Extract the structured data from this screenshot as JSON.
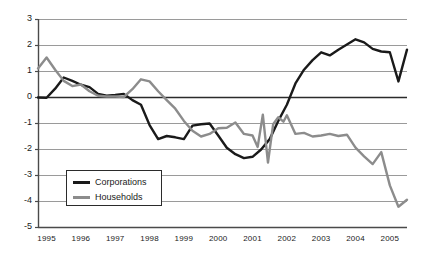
{
  "chart_data": {
    "type": "line",
    "title": "",
    "xlabel": "",
    "ylabel": "",
    "xlim": [
      1994.75,
      2005.5
    ],
    "ylim": [
      -5,
      3
    ],
    "grid": true,
    "legend_position": "lower-left-inside",
    "y_ticks": [
      3,
      2,
      1,
      0,
      -1,
      -2,
      -3,
      -4,
      -5
    ],
    "y_tick_labels": [
      "3",
      "2",
      "1",
      "0",
      "-1",
      "-2",
      "-3",
      "-4",
      "-5"
    ],
    "x_ticks": [
      1995,
      1996,
      1997,
      1998,
      1999,
      2000,
      2001,
      2002,
      2003,
      2004,
      2005
    ],
    "x_tick_labels": [
      "1995",
      "1996",
      "1997",
      "1998",
      "1999",
      "2000",
      "2001",
      "2002",
      "2003",
      "2004",
      "2005"
    ],
    "series": [
      {
        "name": "Corporations",
        "color": "#1a1a1a",
        "width": 2.4,
        "x": [
          1994.75,
          1995.0,
          1995.25,
          1995.5,
          1995.75,
          1996.0,
          1996.25,
          1996.5,
          1996.75,
          1997.0,
          1997.25,
          1997.5,
          1997.75,
          1998.0,
          1998.25,
          1998.5,
          1998.75,
          1999.0,
          1999.25,
          1999.5,
          1999.75,
          2000.0,
          2000.25,
          2000.5,
          2000.75,
          2001.0,
          2001.25,
          2001.5,
          2001.75,
          2002.0,
          2002.25,
          2002.5,
          2002.75,
          2003.0,
          2003.25,
          2003.5,
          2003.75,
          2004.0,
          2004.25,
          2004.5,
          2004.75,
          2005.0,
          2005.25,
          2005.5
        ],
        "y": [
          -0.02,
          -0.03,
          0.32,
          0.75,
          0.62,
          0.47,
          0.38,
          0.12,
          0.05,
          0.08,
          0.12,
          -0.12,
          -0.3,
          -1.08,
          -1.62,
          -1.5,
          -1.55,
          -1.62,
          -1.1,
          -1.05,
          -1.02,
          -1.48,
          -1.95,
          -2.2,
          -2.35,
          -2.3,
          -2.02,
          -1.62,
          -0.92,
          -0.3,
          0.52,
          1.05,
          1.42,
          1.72,
          1.6,
          1.82,
          2.02,
          2.22,
          2.1,
          1.85,
          1.75,
          1.72,
          0.6,
          1.82
        ],
        "notes": "Black line; starts near 0 in late 1994, peaks ~0.75 in 1995, troughs ~-2.35 around 2000-2001, rises to peak ~2.2 in 2003-2004, dips to ~0.6 in late 2004, ends ~1.8 in 2005"
      },
      {
        "name": "Households",
        "color": "#8c8c8c",
        "width": 2.4,
        "x": [
          1994.75,
          1995.0,
          1995.25,
          1995.5,
          1995.75,
          1996.0,
          1996.25,
          1996.5,
          1996.75,
          1997.0,
          1997.25,
          1997.5,
          1997.75,
          1998.0,
          1998.25,
          1998.5,
          1998.75,
          1999.0,
          1999.25,
          1999.5,
          1999.75,
          2000.0,
          2000.25,
          2000.5,
          2000.75,
          2001.0,
          2001.15,
          2001.3,
          2001.45,
          2001.6,
          2001.75,
          2001.9,
          2002.0,
          2002.25,
          2002.5,
          2002.75,
          2003.0,
          2003.25,
          2003.5,
          2003.75,
          2004.0,
          2004.25,
          2004.5,
          2004.75,
          2005.0,
          2005.25,
          2005.5
        ],
        "y": [
          1.1,
          1.52,
          1.05,
          0.62,
          0.42,
          0.48,
          0.22,
          0.05,
          0.02,
          0.02,
          0.0,
          0.3,
          0.68,
          0.6,
          0.22,
          -0.12,
          -0.45,
          -0.92,
          -1.3,
          -1.52,
          -1.42,
          -1.2,
          -1.18,
          -0.98,
          -1.42,
          -1.48,
          -1.92,
          -0.68,
          -2.52,
          -1.05,
          -0.78,
          -0.95,
          -0.7,
          -1.42,
          -1.38,
          -1.52,
          -1.48,
          -1.42,
          -1.5,
          -1.45,
          -1.95,
          -2.28,
          -2.58,
          -2.12,
          -3.4,
          -4.22,
          -3.95
        ],
        "notes": "Gray line; starts ~1.1, peaks ~1.52 early 1995, secondary peak ~0.68 in 1998, volatile spikes around 2001 (down to -2.52, up to -0.68), declines through 2004 to minimum ~-4.22 in 2005, ends ~-3.95"
      }
    ]
  },
  "legend": {
    "items": [
      {
        "label": "Corporations",
        "color": "#1a1a1a"
      },
      {
        "label": "Households",
        "color": "#8c8c8c"
      }
    ]
  },
  "axes": {
    "y_axis_color": "#4a4a4a",
    "gridline_color": "#9a9a9a",
    "zero_line_color": "#2b2b2b"
  }
}
